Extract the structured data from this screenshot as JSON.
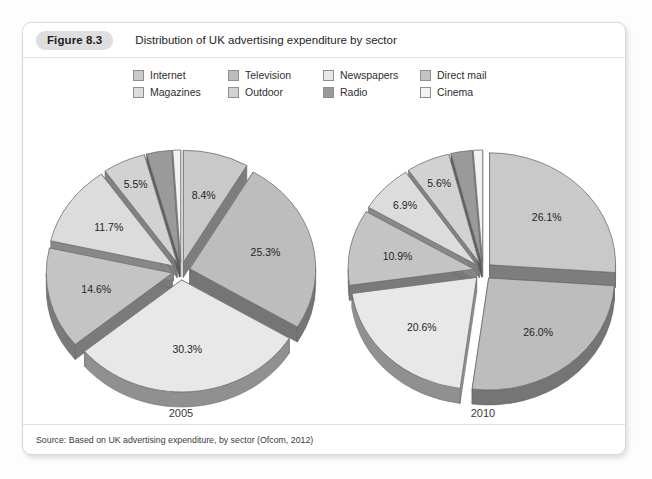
{
  "figure": {
    "badge": "Figure 8.3",
    "title": "Distribution of UK advertising expenditure by sector",
    "source": "Source: Based on UK advertising expenditure, by sector (Ofcom, 2012)"
  },
  "legend": {
    "row1": [
      {
        "label": "Internet",
        "color": "#c9c9c9"
      },
      {
        "label": "Television",
        "color": "#bdbdbd"
      },
      {
        "label": "Newspapers",
        "color": "#e8e8e8"
      },
      {
        "label": "Direct mail",
        "color": "#c4c4c4"
      }
    ],
    "row2": [
      {
        "label": "Magazines",
        "color": "#dcdcdc"
      },
      {
        "label": "Outdoor",
        "color": "#d2d2d2"
      },
      {
        "label": "Radio",
        "color": "#9a9a9a"
      },
      {
        "label": "Cinema",
        "color": "#f2f2f2"
      }
    ]
  },
  "chart_data": [
    {
      "type": "pie",
      "title": "2005",
      "year_label": "2005",
      "exploded": true,
      "three_d": true,
      "categories": [
        "Internet",
        "Television",
        "Newspapers",
        "Direct mail",
        "Magazines",
        "Outdoor",
        "Radio",
        "Cinema"
      ],
      "values": [
        8.4,
        25.3,
        30.3,
        14.6,
        11.7,
        5.5,
        3.2,
        1.0
      ],
      "labels": [
        "8.4%",
        "25.3%",
        "30.3%",
        "14.6%",
        "11.7%",
        "5.5%",
        "3.2%",
        "1.0%"
      ],
      "colors": [
        "#c9c9c9",
        "#bdbdbd",
        "#e8e8e8",
        "#c4c4c4",
        "#dcdcdc",
        "#d2d2d2",
        "#9a9a9a",
        "#f2f2f2"
      ],
      "unit": "%"
    },
    {
      "type": "pie",
      "title": "2010",
      "year_label": "2010",
      "exploded": true,
      "three_d": true,
      "categories": [
        "Internet",
        "Television",
        "Newspapers",
        "Direct mail",
        "Magazines",
        "Outdoor",
        "Radio",
        "Cinema"
      ],
      "values": [
        26.1,
        26.0,
        20.6,
        10.9,
        6.9,
        5.6,
        2.7,
        1.2
      ],
      "labels": [
        "26.1%",
        "26.0%",
        "20.6%",
        "10.9%",
        "6.9%",
        "5.6%",
        "2.7%",
        "1.2%"
      ],
      "colors": [
        "#c9c9c9",
        "#bdbdbd",
        "#e8e8e8",
        "#c4c4c4",
        "#dcdcdc",
        "#d2d2d2",
        "#9a9a9a",
        "#f2f2f2"
      ],
      "unit": "%"
    }
  ]
}
